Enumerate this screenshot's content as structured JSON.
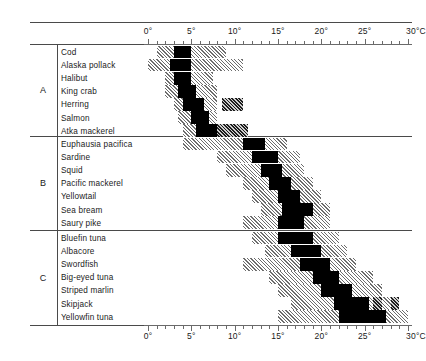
{
  "chart_data": {
    "type": "bar",
    "title": "",
    "xlabel": "°C",
    "ylabel": "",
    "xlim": [
      0,
      30
    ],
    "axis_unit": "°C",
    "grid": false,
    "legend_position": "none",
    "tick_labels": [
      "0°",
      "5°",
      "10°",
      "15°",
      "20°",
      "25°",
      "30°C"
    ],
    "tick_values": [
      0,
      5,
      10,
      15,
      20,
      25,
      30
    ],
    "minor_tick_step": 1,
    "axes_shown": [
      "top",
      "bottom"
    ],
    "series": [
      {
        "name": "optimal",
        "style": "solid-black"
      },
      {
        "name": "tolerance",
        "style": "hatched"
      }
    ],
    "groups": [
      {
        "letter": "A",
        "species": [
          {
            "name": "Cod",
            "tolerance": [
              [
                1.0,
                9.0
              ]
            ],
            "optimal": [
              [
                3.0,
                5.0
              ]
            ]
          },
          {
            "name": "Alaska pollack",
            "tolerance": [
              [
                0.0,
                11.0
              ]
            ],
            "optimal": [
              [
                2.5,
                5.0
              ]
            ]
          },
          {
            "name": "Halibut",
            "tolerance": [
              [
                2.0,
                7.5
              ]
            ],
            "optimal": [
              [
                3.0,
                5.0
              ]
            ]
          },
          {
            "name": "King crab",
            "tolerance": [
              [
                2.0,
                8.0
              ]
            ],
            "optimal": [
              [
                3.5,
                5.5
              ]
            ]
          },
          {
            "name": "Herring",
            "tolerance": [
              [
                3.0,
                8.0
              ],
              [
                8.5,
                11.0
              ]
            ],
            "optimal": [
              [
                4.0,
                6.5
              ]
            ]
          },
          {
            "name": "Salmon",
            "tolerance": [
              [
                3.5,
                8.0
              ]
            ],
            "optimal": [
              [
                5.0,
                7.0
              ]
            ]
          },
          {
            "name": "Atka mackerel",
            "tolerance": [
              [
                4.0,
                8.0
              ],
              [
                8.0,
                11.5
              ]
            ],
            "optimal": [
              [
                5.5,
                8.0
              ]
            ]
          }
        ]
      },
      {
        "letter": "B",
        "species": [
          {
            "name": "Euphausia pacifica",
            "tolerance": [
              [
                4.0,
                16.0
              ]
            ],
            "optimal": [
              [
                11.0,
                13.5
              ]
            ]
          },
          {
            "name": "Sardine",
            "tolerance": [
              [
                8.0,
                17.5
              ]
            ],
            "optimal": [
              [
                12.0,
                15.0
              ]
            ]
          },
          {
            "name": "Squid",
            "tolerance": [
              [
                9.0,
                18.0
              ]
            ],
            "optimal": [
              [
                13.0,
                15.5
              ]
            ]
          },
          {
            "name": "Pacific mackerel",
            "tolerance": [
              [
                11.0,
                19.0
              ]
            ],
            "optimal": [
              [
                14.0,
                16.5
              ]
            ]
          },
          {
            "name": "Yellowtail",
            "tolerance": [
              [
                12.0,
                20.0
              ]
            ],
            "optimal": [
              [
                15.0,
                17.5
              ]
            ]
          },
          {
            "name": "Sea bream",
            "tolerance": [
              [
                13.0,
                21.0
              ]
            ],
            "optimal": [
              [
                15.5,
                19.0
              ]
            ]
          },
          {
            "name": "Saury pike",
            "tolerance": [
              [
                11.0,
                21.0
              ]
            ],
            "optimal": [
              [
                15.0,
                18.0
              ]
            ]
          }
        ]
      },
      {
        "letter": "C",
        "species": [
          {
            "name": "Bluefin tuna",
            "tolerance": [
              [
                12.0,
                22.0
              ]
            ],
            "optimal": [
              [
                15.0,
                19.0
              ]
            ]
          },
          {
            "name": "Albacore",
            "tolerance": [
              [
                13.5,
                23.0
              ]
            ],
            "optimal": [
              [
                16.5,
                20.0
              ]
            ]
          },
          {
            "name": "Swordfish",
            "tolerance": [
              [
                11.0,
                24.0
              ]
            ],
            "optimal": [
              [
                17.5,
                21.0
              ]
            ]
          },
          {
            "name": "Big-eyed tuna",
            "tolerance": [
              [
                14.0,
                26.0
              ]
            ],
            "optimal": [
              [
                19.0,
                22.0
              ]
            ]
          },
          {
            "name": "Striped marlin",
            "tolerance": [
              [
                15.0,
                27.0
              ]
            ],
            "optimal": [
              [
                20.0,
                23.5
              ]
            ]
          },
          {
            "name": "Skipjack",
            "tolerance": [
              [
                16.5,
                28.5
              ],
              [
                26.0,
                27.0
              ],
              [
                28.0,
                29.0
              ]
            ],
            "optimal": [
              [
                21.5,
                25.5
              ]
            ]
          },
          {
            "name": "Yellowfin tuna",
            "tolerance": [
              [
                15.0,
                30.0
              ]
            ],
            "optimal": [
              [
                22.0,
                27.5
              ]
            ]
          }
        ]
      }
    ]
  }
}
